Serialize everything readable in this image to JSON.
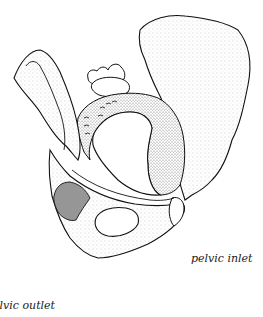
{
  "figure": {
    "colors": {
      "line": "#111111",
      "stipple": "#8a8a8a",
      "background": "#ffffff"
    }
  },
  "labels": {
    "inlet": "pelvic inlet",
    "outlet_partial": "pelvic outlet"
  }
}
